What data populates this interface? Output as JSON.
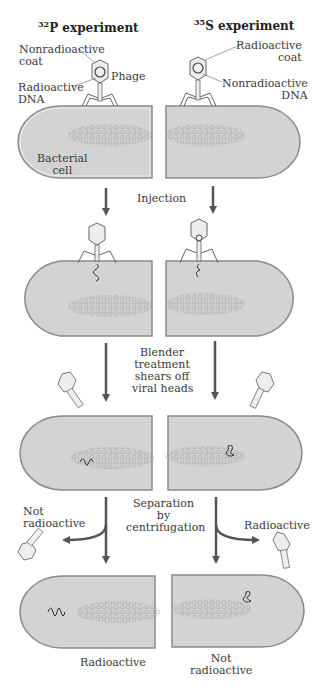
{
  "titles": {
    "left": {
      "isotope_mass": "32",
      "isotope": "P",
      "suffix": " experiment"
    },
    "right": {
      "isotope_mass": "35",
      "isotope": "S",
      "suffix": " experiment"
    }
  },
  "labels": {
    "left_coat": [
      "Nonradioactive",
      "coat"
    ],
    "left_dna": [
      "Radioactive",
      "DNA"
    ],
    "phage": "Phage",
    "right_coat": [
      "Radioactive",
      "coat"
    ],
    "right_dna": [
      "Nonradioactive",
      "DNA"
    ],
    "bacterial_cell": [
      "Bacterial",
      "cell"
    ]
  },
  "steps": {
    "injection": "Injection",
    "blender": [
      "Blender",
      "treatment",
      "shears off",
      "viral heads"
    ],
    "separation": [
      "Separation",
      "by",
      "centrifugation"
    ]
  },
  "results": {
    "left_supernatant": [
      "Not",
      "radioactive"
    ],
    "right_supernatant": "Radioactive",
    "left_pellet": "Radioactive",
    "right_pellet": [
      "Not",
      "radioactive"
    ]
  },
  "colors": {
    "cell_fill": "#d3d3d3",
    "cell_border": "#8a8a8a",
    "arrow": "#555555",
    "text": "#333333"
  }
}
